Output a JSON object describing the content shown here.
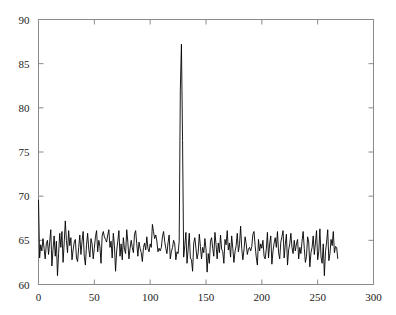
{
  "chart_data": {
    "type": "line",
    "title": "",
    "xlabel": "",
    "ylabel": "",
    "xlim": [
      0,
      300
    ],
    "ylim": [
      60,
      90
    ],
    "xticks": [
      0,
      50,
      100,
      150,
      200,
      250,
      300
    ],
    "yticks": [
      60,
      65,
      70,
      75,
      80,
      85,
      90
    ],
    "grid": false,
    "legend": null,
    "series": [
      {
        "name": "signal",
        "color": "#000000",
        "x_start": 0,
        "x_step": 1,
        "values": [
          69.6,
          63.0,
          64.5,
          63.8,
          65.2,
          64.1,
          62.9,
          64.6,
          65.0,
          63.4,
          64.8,
          66.2,
          62.1,
          64.0,
          65.5,
          63.2,
          64.9,
          61.0,
          63.5,
          65.8,
          64.2,
          66.0,
          62.5,
          64.7,
          67.2,
          65.0,
          63.6,
          66.1,
          64.4,
          65.3,
          62.8,
          63.9,
          64.8,
          65.1,
          63.0,
          62.6,
          64.2,
          65.6,
          63.4,
          64.9,
          66.0,
          63.2,
          62.2,
          64.5,
          65.8,
          64.0,
          63.1,
          65.2,
          64.6,
          62.9,
          64.1,
          65.4,
          66.1,
          63.7,
          65.0,
          64.3,
          62.4,
          65.5,
          66.0,
          65.4,
          65.1,
          64.8,
          65.6,
          66.2,
          64.2,
          64.9,
          63.0,
          65.8,
          64.4,
          61.5,
          63.8,
          64.9,
          66.1,
          63.2,
          64.6,
          62.8,
          65.3,
          64.0,
          63.5,
          66.2,
          64.8,
          62.9,
          64.1,
          65.0,
          64.2,
          63.6,
          65.7,
          66.1,
          64.6,
          63.2,
          64.8,
          64.1,
          63.6,
          62.6,
          64.2,
          64.7,
          63.9,
          65.4,
          64.1,
          63.7,
          64.6,
          64.2,
          66.8,
          66.0,
          65.2,
          65.6,
          64.9,
          63.7,
          64.1,
          63.8,
          64.2,
          65.4,
          66.0,
          64.9,
          64.1,
          63.5,
          64.7,
          65.6,
          62.9,
          63.7,
          64.2,
          65.0,
          64.6,
          62.8,
          63.7,
          63.5,
          64.9,
          82.0,
          87.2,
          76.3,
          63.1,
          64.4,
          65.9,
          62.4,
          64.0,
          65.8,
          63.0,
          62.8,
          61.5,
          64.7,
          65.3,
          64.1,
          62.9,
          63.6,
          65.7,
          64.3,
          62.9,
          64.2,
          63.6,
          65.2,
          64.0,
          61.4,
          63.5,
          62.4,
          64.9,
          65.3,
          64.1,
          63.2,
          65.9,
          64.5,
          62.9,
          64.7,
          63.6,
          65.6,
          64.0,
          63.7,
          62.4,
          65.1,
          64.5,
          66.1,
          63.9,
          64.7,
          63.1,
          65.5,
          64.1,
          62.5,
          63.7,
          64.4,
          65.8,
          63.7,
          64.5,
          66.6,
          64.1,
          62.8,
          63.9,
          65.4,
          64.6,
          63.4,
          64.0,
          64.2,
          63.8,
          64.3,
          65.7,
          66.0,
          64.4,
          63.1,
          62.2,
          65.1,
          63.8,
          64.6,
          64.1,
          65.0,
          63.2,
          62.9,
          64.0,
          65.9,
          63.0,
          64.6,
          65.5,
          62.3,
          63.8,
          64.7,
          65.3,
          64.2,
          66.0,
          63.6,
          62.9,
          64.8,
          65.4,
          66.1,
          63.0,
          64.5,
          65.7,
          62.2,
          63.9,
          64.6,
          65.8,
          64.2,
          63.5,
          65.0,
          63.8,
          64.6,
          65.1,
          62.9,
          64.2,
          63.5,
          64.9,
          66.0,
          64.1,
          62.5,
          63.2,
          65.4,
          64.8,
          62.0,
          63.6,
          64.2,
          65.5,
          63.4,
          64.7,
          66.1,
          62.8,
          63.7,
          66.3,
          63.1,
          62.4,
          64.6,
          61.0,
          63.7,
          64.8,
          66.2,
          62.7,
          63.5,
          65.1,
          64.4,
          66.0,
          63.6,
          64.3,
          64.2,
          62.9
        ]
      }
    ]
  },
  "axes": {
    "x_tick_labels": [
      "0",
      "50",
      "100",
      "150",
      "200",
      "250",
      "300"
    ],
    "y_tick_labels": [
      "60",
      "65",
      "70",
      "75",
      "80",
      "85",
      "90"
    ]
  }
}
